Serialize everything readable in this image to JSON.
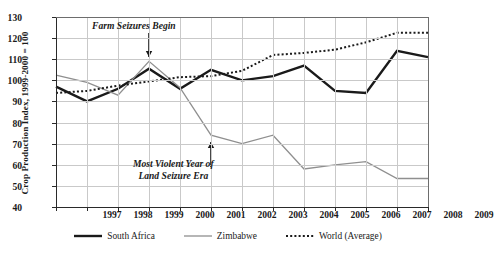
{
  "chart_data": {
    "type": "line",
    "title": "",
    "xlabel": "",
    "ylabel": "Crop Production Index, 1999-2000 = 100",
    "categories": [
      1997,
      1998,
      1999,
      2000,
      2001,
      2002,
      2003,
      2004,
      2005,
      2006,
      2007,
      2008,
      2009
    ],
    "x": [
      1997,
      1998,
      1999,
      2000,
      2001,
      2002,
      2003,
      2004,
      2005,
      2006,
      2007,
      2008,
      2009
    ],
    "xlim": [
      1997,
      2009
    ],
    "ylim": [
      40,
      130
    ],
    "yticks": [
      40,
      50,
      60,
      70,
      80,
      90,
      100,
      110,
      120,
      130
    ],
    "xticks": [
      1997,
      1998,
      1999,
      2000,
      2001,
      2002,
      2003,
      2004,
      2005,
      2006,
      2007,
      2008,
      2009
    ],
    "grid": true,
    "legend_position": "bottom",
    "series": [
      {
        "name": "South Africa",
        "style": "solid-thick",
        "color": "#1a1a1a",
        "values": [
          97,
          90,
          96,
          105.5,
          96,
          105,
          100,
          102,
          107,
          95,
          94,
          114,
          111
        ]
      },
      {
        "name": "Zimbabwe",
        "style": "solid-thin",
        "color": "#8f8f8f",
        "values": [
          102.5,
          99,
          93,
          109,
          96.5,
          74,
          70,
          74,
          58,
          60,
          61.5,
          53.5,
          53.5
        ]
      },
      {
        "name": "World (Average)",
        "style": "dotted",
        "color": "#1a1a1a",
        "values": [
          94,
          95,
          97.5,
          99.5,
          101.5,
          102,
          104.5,
          112,
          113,
          114.5,
          118,
          122.5,
          122.5
        ]
      }
    ],
    "annotations": [
      {
        "id": "farm-seizures",
        "text": "Farm Seizures Begin",
        "at_x": 2000,
        "arrow": "down"
      },
      {
        "id": "most-violent",
        "line1": "Most Violent Year of",
        "line2": "Land Seizure Era",
        "at_x": 2002,
        "arrow": "up"
      }
    ]
  },
  "legend": {
    "items": [
      {
        "label": "South Africa",
        "swatch": "solid-thick-black"
      },
      {
        "label": "Zimbabwe",
        "swatch": "solid-thin-gray"
      },
      {
        "label": "World (Average)",
        "swatch": "dotted-black"
      }
    ]
  },
  "colors": {
    "south_africa": "#1a1a1a",
    "zimbabwe": "#8f8f8f",
    "world": "#1a1a1a",
    "grid": "#c9c9c9",
    "axis": "#2a2a2a",
    "background": "#ffffff"
  }
}
